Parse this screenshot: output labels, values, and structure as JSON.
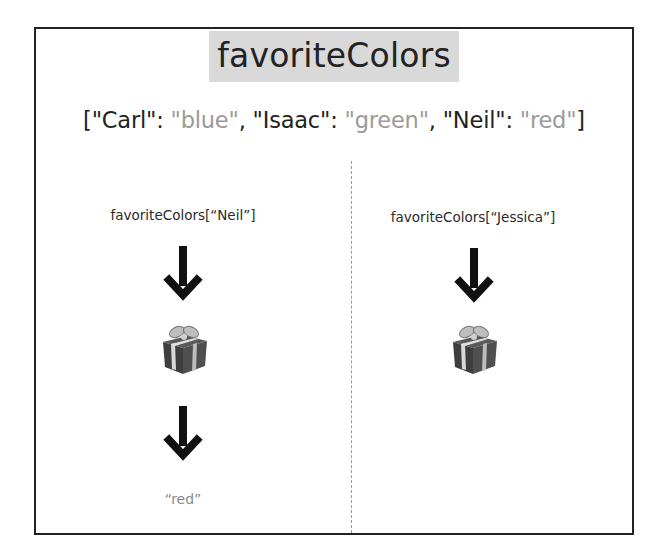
{
  "diagram": {
    "title": "favoriteColors",
    "dictionary": {
      "open": "[",
      "close": "]",
      "entries": [
        {
          "key": "\"Carl\"",
          "value": "\"blue\"",
          "value_color": "#9a9a9a"
        },
        {
          "key": "\"Isaac\"",
          "value": "\"green\"",
          "value_color": "#9a9a9a"
        },
        {
          "key": "\"Neil\"",
          "value": "\"red\"",
          "value_color": "#9a9a9a"
        }
      ],
      "separator": ": ",
      "delimiter": ", "
    },
    "left_column": {
      "expression": "favoriteColors[“Neil”]",
      "steps": [
        "arrow-down-icon",
        "gift-icon",
        "arrow-down-icon"
      ],
      "result": "“red”"
    },
    "right_column": {
      "expression": "favoriteColors[“Jessica”]",
      "steps": [
        "arrow-down-icon",
        "gift-icon"
      ]
    }
  }
}
